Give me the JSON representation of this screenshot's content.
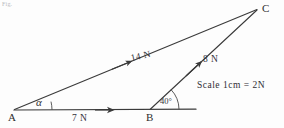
{
  "figure": {
    "caption": "Fig.",
    "scale_note": "Scale 1cm = 2N",
    "points": [
      {
        "id": "A",
        "label": "A",
        "x": 14,
        "y": 110
      },
      {
        "id": "B",
        "label": "B",
        "x": 150,
        "y": 110
      },
      {
        "id": "C",
        "label": "C",
        "x": 256,
        "y": 9
      }
    ],
    "vectors": [
      {
        "id": "AB",
        "label": "7 N",
        "magnitude": 7,
        "unit": "N",
        "from": "A",
        "to": "B"
      },
      {
        "id": "AC",
        "label": "14 N",
        "magnitude": 14,
        "unit": "N",
        "from": "A",
        "to": "C"
      },
      {
        "id": "BC",
        "label": "8 N",
        "magnitude": 8,
        "unit": "N",
        "from": "B",
        "to": "C"
      }
    ],
    "angles": [
      {
        "id": "alpha",
        "label": "α",
        "at": "A",
        "value": ""
      },
      {
        "id": "forty",
        "label": "40",
        "degree_symbol": "°",
        "at": "B",
        "value": "40°"
      }
    ],
    "colors": {
      "ink": "#3a3a3a",
      "background": "#fdfdfd",
      "faint": "#b9b9bd"
    }
  }
}
